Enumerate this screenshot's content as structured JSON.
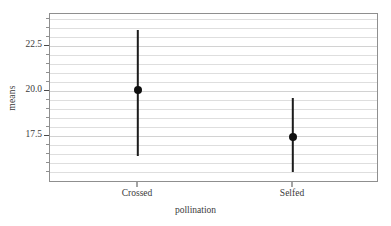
{
  "chart_data": {
    "type": "scatter",
    "title": "",
    "subtitle": "",
    "xlabel": "pollination",
    "ylabel": "means",
    "categories": [
      "Crossed",
      "Selfed"
    ],
    "values": [
      20.05,
      17.47
    ],
    "error_low": [
      16.4,
      15.5
    ],
    "error_high": [
      23.4,
      19.6
    ],
    "series": [
      {
        "name": "means",
        "points": [
          {
            "x": "Crossed",
            "y": 20.05,
            "lower": 16.4,
            "upper": 23.4
          },
          {
            "x": "Selfed",
            "y": 17.47,
            "lower": 15.5,
            "upper": 19.6
          }
        ]
      }
    ],
    "ylim": [
      15.1,
      24.5
    ],
    "ytick_labels": [
      "22.5",
      "20.0",
      "17.5"
    ],
    "ytick_values": [
      22.5,
      20.0,
      17.5
    ],
    "yminor_step": 0.5,
    "grid": true,
    "grid_axis": "y",
    "legend": "none",
    "annotations": [],
    "marker_style": "filled-circle",
    "errorbar_style": "vertical-line"
  },
  "axes": {
    "y_title": "means",
    "x_title": "pollination",
    "y_ticks": [
      {
        "label": "22.5",
        "value": 22.5
      },
      {
        "label": "20.0",
        "value": 20.0
      },
      {
        "label": "17.5",
        "value": 17.5
      }
    ],
    "x_ticks": [
      {
        "label": "Crossed"
      },
      {
        "label": "Selfed"
      }
    ]
  },
  "colors": {
    "marker": "#101010",
    "errorbar": "#1c1c1c",
    "gridline": "#dedede",
    "frame": "#8f8f8f",
    "text": "#3b3b3b",
    "background": "#ffffff"
  }
}
